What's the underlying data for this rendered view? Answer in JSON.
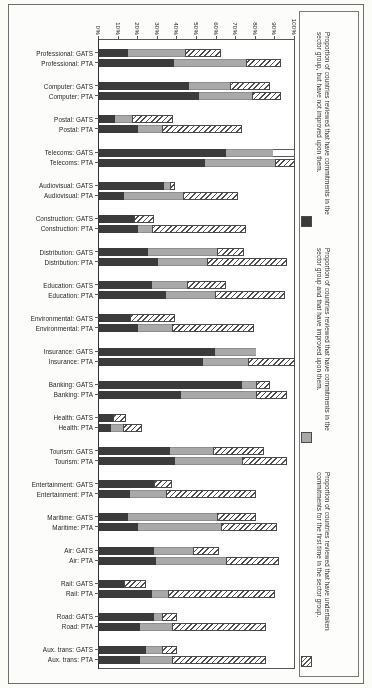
{
  "figure": {
    "axis_min_label": "0%",
    "axis_max_label": "100%",
    "orientation": "rotated-180-horizontal-stacked-bar"
  },
  "legend": {
    "items": [
      {
        "swatch": "hatched-diagonal",
        "text": "Proportion of countries reviewed that have undertaken commitments for the first time in the sector group."
      },
      {
        "swatch": "gray-fill",
        "text": "Proportion of countries reviewed that have commitments in the sector group and that have improved upon them."
      },
      {
        "swatch": "dark-fill",
        "text": "Proportion of countries reviewed that have commitments in the sector group, but have not improved upon them."
      }
    ]
  },
  "axis": {
    "ticks": [
      "100%",
      "90%",
      "80%",
      "70%",
      "60%",
      "50%",
      "40%",
      "30%",
      "20%",
      "10%",
      "0%"
    ]
  },
  "chart_data": {
    "type": "bar",
    "subtype": "stacked-horizontal",
    "title": "",
    "xlabel": "",
    "ylabel": "",
    "xlim": [
      0,
      100
    ],
    "grid": false,
    "legend_position": "right",
    "series": [
      {
        "name": "Proportion of countries reviewed that have undertaken commitments for the first time in the sector group.",
        "key": "first_time",
        "style": "hatched"
      },
      {
        "name": "Proportion of countries reviewed that have commitments in the sector group and that have improved upon them.",
        "key": "improved",
        "style": "gray"
      },
      {
        "name": "Proportion of countries reviewed that have commitments in the sector group, but have not improved upon them.",
        "key": "not_improved",
        "style": "dark"
      }
    ],
    "categories": [
      "Aux. trans: PTA",
      "Aux. trans: GATS",
      "Road: PTA",
      "Road: GATS",
      "Rail: PTA",
      "Rail: GATS",
      "Air: PTA",
      "Air: GATS",
      "Maritime: PTA",
      "Maritime: GATS",
      "Entertainment: PTA",
      "Entertainment: GATS",
      "Tourism: PTA",
      "Tourism: GATS",
      "Health: PTA",
      "Health: GATS",
      "Banking: PTA",
      "Banking: GATS",
      "Insurance: PTA",
      "Insurance: GATS",
      "Environmental: PTA",
      "Environmental: GATS",
      "Education: PTA",
      "Education: GATS",
      "Distribution: PTA",
      "Distribution: GATS",
      "Construction: PTA",
      "Construction: GATS",
      "Audiovisual: PTA",
      "Audiovisual: GATS",
      "Telecoms: PTA",
      "Telecoms: GATS",
      "Postal: PTA",
      "Postal: GATS",
      "Computer: PTA",
      "Computer: GATS",
      "Professional: PTA",
      "Professional: GATS"
    ],
    "bars": [
      {
        "category": "Aux. trans: PTA",
        "blank": 0,
        "first_time": 48,
        "improved": 16,
        "not_improved": 21
      },
      {
        "category": "Aux. trans: GATS",
        "blank": 0,
        "first_time": 8,
        "improved": 8,
        "not_improved": 24
      },
      {
        "category": "Road: PTA",
        "blank": 0,
        "first_time": 48,
        "improved": 16,
        "not_improved": 21
      },
      {
        "category": "Road: GATS",
        "blank": 0,
        "first_time": 8,
        "improved": 4,
        "not_improved": 28
      },
      {
        "category": "Rail: PTA",
        "blank": 0,
        "first_time": 55,
        "improved": 8,
        "not_improved": 27
      },
      {
        "category": "Rail: GATS",
        "blank": 0,
        "first_time": 11,
        "improved": 0,
        "not_improved": 13
      },
      {
        "category": "Air: PTA",
        "blank": 0,
        "first_time": 27,
        "improved": 36,
        "not_improved": 29
      },
      {
        "category": "Air: GATS",
        "blank": 0,
        "first_time": 13,
        "improved": 20,
        "not_improved": 28
      },
      {
        "category": "Maritime: PTA",
        "blank": 0,
        "first_time": 29,
        "improved": 42,
        "not_improved": 20
      },
      {
        "category": "Maritime: GATS",
        "blank": 0,
        "first_time": 20,
        "improved": 45,
        "not_improved": 15
      },
      {
        "category": "Entertainment: PTA",
        "blank": 0,
        "first_time": 46,
        "improved": 18,
        "not_improved": 16
      },
      {
        "category": "Entertainment: GATS",
        "blank": 0,
        "first_time": 9,
        "improved": 0,
        "not_improved": 28
      },
      {
        "category": "Tourism: PTA",
        "blank": 0,
        "first_time": 23,
        "improved": 34,
        "not_improved": 39
      },
      {
        "category": "Tourism: GATS",
        "blank": 0,
        "first_time": 26,
        "improved": 22,
        "not_improved": 36
      },
      {
        "category": "Health: PTA",
        "blank": 0,
        "first_time": 10,
        "improved": 6,
        "not_improved": 6
      },
      {
        "category": "Health: GATS",
        "blank": 0,
        "first_time": 7,
        "improved": 0,
        "not_improved": 7
      },
      {
        "category": "Banking: PTA",
        "blank": 0,
        "first_time": 16,
        "improved": 38,
        "not_improved": 42
      },
      {
        "category": "Banking: GATS",
        "blank": 0,
        "first_time": 7,
        "improved": 7,
        "not_improved": 73
      },
      {
        "category": "Insurance: PTA",
        "blank": 0,
        "first_time": 24,
        "improved": 23,
        "not_improved": 53
      },
      {
        "category": "Insurance: GATS",
        "blank": 0,
        "first_time": 0,
        "improved": 21,
        "not_improved": 59
      },
      {
        "category": "Environmental: PTA",
        "blank": 0,
        "first_time": 42,
        "improved": 17,
        "not_improved": 20
      },
      {
        "category": "Environmental: GATS",
        "blank": 0,
        "first_time": 23,
        "improved": 0,
        "not_improved": 16
      },
      {
        "category": "Education: PTA",
        "blank": 0,
        "first_time": 36,
        "improved": 25,
        "not_improved": 34
      },
      {
        "category": "Education: GATS",
        "blank": 0,
        "first_time": 20,
        "improved": 18,
        "not_improved": 27
      },
      {
        "category": "Distribution: PTA",
        "blank": 0,
        "first_time": 41,
        "improved": 25,
        "not_improved": 30
      },
      {
        "category": "Distribution: GATS",
        "blank": 0,
        "first_time": 14,
        "improved": 35,
        "not_improved": 25
      },
      {
        "category": "Construction: PTA",
        "blank": 0,
        "first_time": 48,
        "improved": 7,
        "not_improved": 20
      },
      {
        "category": "Construction: GATS",
        "blank": 0,
        "first_time": 10,
        "improved": 0,
        "not_improved": 18
      },
      {
        "category": "Audiovisual: PTA",
        "blank": 0,
        "first_time": 28,
        "improved": 30,
        "not_improved": 13
      },
      {
        "category": "Audiovisual: GATS",
        "blank": 0,
        "first_time": 3,
        "improved": 3,
        "not_improved": 33
      },
      {
        "category": "Telecoms: PTA",
        "blank": 0,
        "first_time": 10,
        "improved": 36,
        "not_improved": 54
      },
      {
        "category": "Telecoms: GATS",
        "blank": 11,
        "first_time": 0,
        "improved": 24,
        "not_improved": 65
      },
      {
        "category": "Postal: PTA",
        "blank": 0,
        "first_time": 41,
        "improved": 12,
        "not_improved": 20
      },
      {
        "category": "Postal: GATS",
        "blank": 0,
        "first_time": 21,
        "improved": 9,
        "not_improved": 8
      },
      {
        "category": "Computer: PTA",
        "blank": 0,
        "first_time": 15,
        "improved": 27,
        "not_improved": 51
      },
      {
        "category": "Computer: GATS",
        "blank": 0,
        "first_time": 20,
        "improved": 21,
        "not_improved": 46
      },
      {
        "category": "Professional: PTA",
        "blank": 0,
        "first_time": 18,
        "improved": 37,
        "not_improved": 38
      },
      {
        "category": "Professional: GATS",
        "blank": 0,
        "first_time": 18,
        "improved": 29,
        "not_improved": 15
      }
    ]
  }
}
